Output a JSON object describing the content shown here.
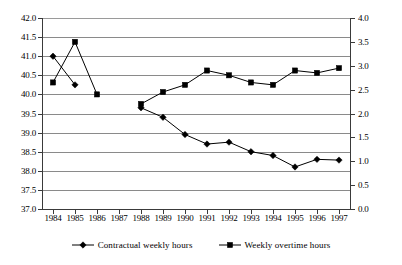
{
  "chart_data": {
    "type": "line",
    "title": "",
    "xlabel": "",
    "ylabel": "",
    "grid": true,
    "legend_position": "bottom",
    "categories": [
      "1984",
      "1985",
      "1986",
      "1987",
      "1988",
      "1989",
      "1990",
      "1991",
      "1992",
      "1993",
      "1994",
      "1995",
      "1996",
      "1997"
    ],
    "axes": {
      "left": {
        "label": "",
        "ylim": [
          37.0,
          42.0
        ],
        "step": 0.5,
        "ticks": [
          "37.0",
          "37.5",
          "38.0",
          "38.5",
          "39.0",
          "39.5",
          "40.0",
          "40.5",
          "41.0",
          "41.5",
          "42.0"
        ]
      },
      "right": {
        "label": "",
        "ylim": [
          0.0,
          4.0
        ],
        "step": 0.5,
        "ticks": [
          "0.0",
          "0.5",
          "1.0",
          "1.5",
          "2.0",
          "2.5",
          "3.0",
          "3.5",
          "4.0"
        ]
      }
    },
    "series": [
      {
        "name": "Contractual weekly hours",
        "axis": "left",
        "marker": "diamond",
        "color": "#000000",
        "values": [
          41.0,
          40.25,
          null,
          null,
          39.65,
          39.4,
          38.95,
          38.7,
          38.75,
          38.5,
          38.4,
          38.1,
          38.3,
          38.28
        ]
      },
      {
        "name": "Weekly overtime hours",
        "axis": "right",
        "marker": "square",
        "color": "#000000",
        "values": [
          2.65,
          3.5,
          2.4,
          null,
          2.2,
          2.45,
          2.6,
          2.9,
          2.8,
          2.65,
          2.6,
          2.9,
          2.85,
          2.95
        ]
      }
    ]
  },
  "legend": {
    "entries": [
      {
        "label": "Contractual weekly hours",
        "marker": "diamond-marker"
      },
      {
        "label": "Weekly overtime hours",
        "marker": "square-marker"
      }
    ]
  }
}
